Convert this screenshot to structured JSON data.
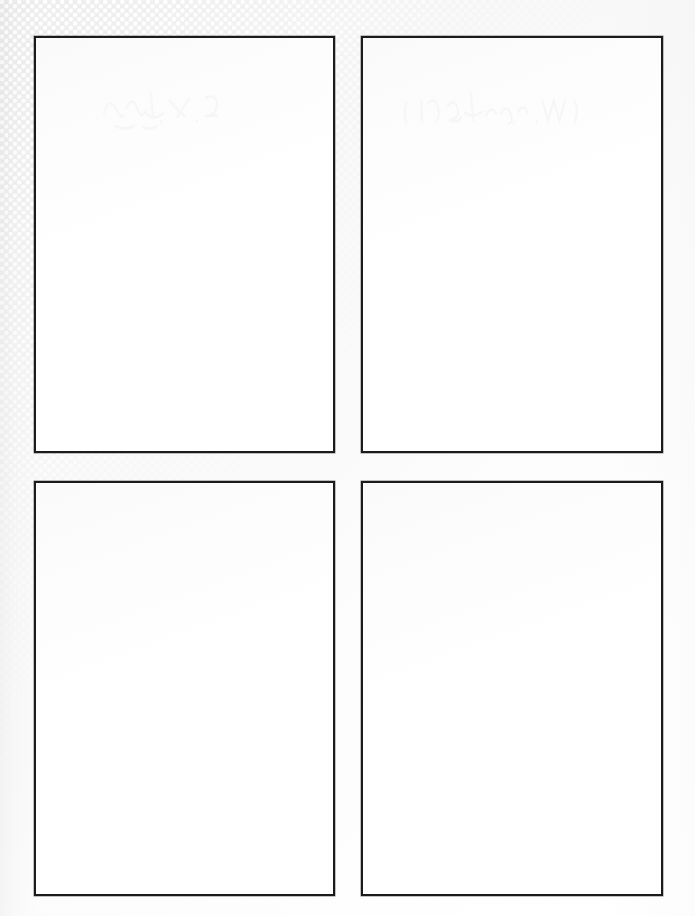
{
  "document": {
    "kind": "scanned-paper-sheet",
    "title": "Blank four-panel page",
    "page_width": 695,
    "page_height": 916,
    "background_color": "#f2f2f3",
    "paper_color": "#ffffff",
    "ink_color": "#1b1b1e",
    "texture": {
      "name": "halftone-dot-screen",
      "dot_color": "#ffffff",
      "base_color": "#ececed",
      "pitch_px": 8.6,
      "dot_radius_px": 2.0,
      "fade_direction": "top-left to bottom-right"
    }
  },
  "grid": {
    "columns": 2,
    "rows": 2,
    "gutter_horizontal_px": 26,
    "gutter_vertical_px": 28,
    "margin_left_px": 34,
    "margin_top_px": 36,
    "margin_right_px": 32,
    "margin_bottom_px": 20
  },
  "panels": [
    {
      "id": "panel-1",
      "position": "top-left",
      "content": "",
      "x": 34,
      "y": 36,
      "width": 301,
      "height": 417,
      "border_width_px": 2,
      "border_color": "#1b1b1e",
      "fill_color": "#ffffff",
      "has_bleed_through": true
    },
    {
      "id": "panel-2",
      "position": "top-right",
      "content": "",
      "x": 361,
      "y": 36,
      "width": 302,
      "height": 417,
      "border_width_px": 2,
      "border_color": "#1b1b1e",
      "fill_color": "#ffffff",
      "has_bleed_through": true
    },
    {
      "id": "panel-3",
      "position": "bottom-left",
      "content": "",
      "x": 34,
      "y": 481,
      "width": 301,
      "height": 415,
      "border_width_px": 2,
      "border_color": "#1b1b1e",
      "fill_color": "#ffffff",
      "has_bleed_through": false
    },
    {
      "id": "panel-4",
      "position": "bottom-right",
      "content": "",
      "x": 361,
      "y": 481,
      "width": 302,
      "height": 415,
      "border_width_px": 2,
      "border_color": "#1b1b1e",
      "fill_color": "#ffffff",
      "has_bleed_through": false
    }
  ]
}
